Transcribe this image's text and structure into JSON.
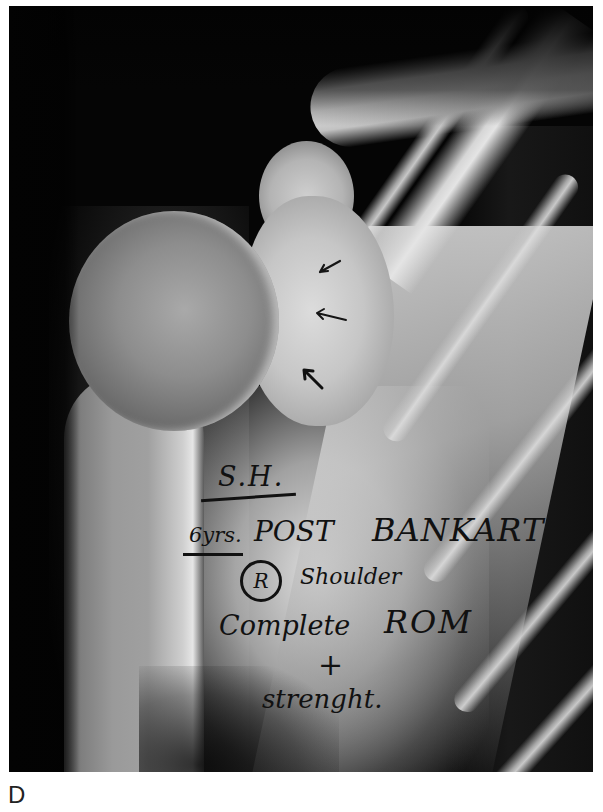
{
  "figure": {
    "panel_label": "D",
    "image_type": "X-ray",
    "annotation": {
      "initials": "S.H.",
      "line1_years": "6yrs.",
      "line1_post": "POST",
      "line1_procedure": "BANKART",
      "line2_side": "R",
      "line2_part": "Shoulder",
      "line3_complete": "Complete",
      "line3_rom": "ROM",
      "line4_plus": "+",
      "line5": "strenght."
    },
    "arrows": [
      {
        "name": "arrow-upper",
        "direction": "down-left"
      },
      {
        "name": "arrow-middle",
        "direction": "left"
      },
      {
        "name": "arrow-lower",
        "direction": "up-left"
      }
    ]
  }
}
